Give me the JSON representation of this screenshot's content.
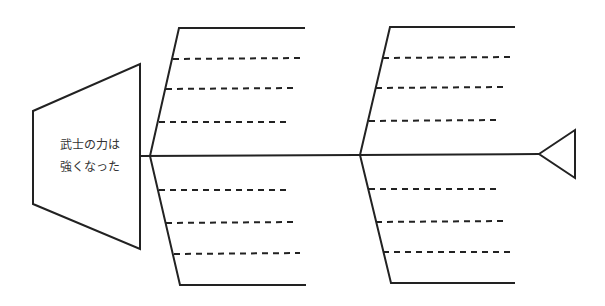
{
  "diagram": {
    "type": "fishbone",
    "head_label_line1": "武士の力は",
    "head_label_line2": "強くなった",
    "bones": [
      {
        "position": "left-upper",
        "slots": 3
      },
      {
        "position": "left-lower",
        "slots": 3
      },
      {
        "position": "right-upper",
        "slots": 3
      },
      {
        "position": "right-lower",
        "slots": 3
      }
    ],
    "line_color": "#222222"
  }
}
